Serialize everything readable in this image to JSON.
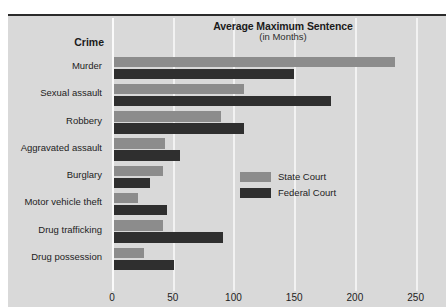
{
  "chart_data": {
    "type": "bar",
    "orientation": "horizontal",
    "title": "Average Maximum Sentence",
    "subtitle": "(in Months)",
    "category_header": "Crime",
    "xlabel": "",
    "ylabel": "Crime",
    "xlim": [
      0,
      275
    ],
    "xticks": [
      0,
      50,
      100,
      150,
      200,
      250
    ],
    "grid": true,
    "legend_position": "right",
    "categories": [
      "Murder",
      "Sexual assault",
      "Robbery",
      "Aggravated assault",
      "Burglary",
      "Motor vehicle theft",
      "Drug trafficking",
      "Drug possession"
    ],
    "series": [
      {
        "name": "State Court",
        "color": "#8c8c8c",
        "values": [
          231,
          107,
          88,
          42,
          40,
          20,
          40,
          25
        ]
      },
      {
        "name": "Federal Court",
        "color": "#2f2f2f",
        "values": [
          148,
          179,
          107,
          54,
          30,
          44,
          90,
          49
        ]
      }
    ]
  },
  "colors": {
    "background": "#d9d9d9",
    "gridline": "#f2f2f2",
    "state_court": "#8c8c8c",
    "federal_court": "#2f2f2f",
    "text": "#1d1d1d",
    "frame_top": "#2b2b2b"
  }
}
